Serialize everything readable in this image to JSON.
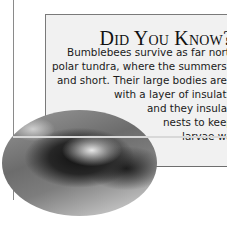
{
  "sidebar": {
    "title": "Did You Know?",
    "lines": [
      "Bumblebees survive as far north",
      "polar tundra, where the summers a",
      "and short. Their large bodies are c",
      "with a layer of insulatir",
      "and they insulat",
      "nests to keep",
      "larvae wa"
    ]
  },
  "image": {
    "subject": "bumblebee close-up photograph (grayscale, oval crop)"
  },
  "colors": {
    "box_background": "#f1f1f1",
    "border": "#7a7a7a",
    "text": "#1a1a1a"
  }
}
